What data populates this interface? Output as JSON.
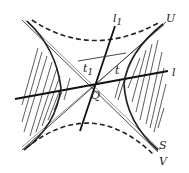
{
  "diagram": {
    "type": "geometry",
    "center": {
      "label": "Q"
    },
    "labels": {
      "U": "U",
      "S": "S",
      "V": "V",
      "l": "l",
      "l1_main": "l",
      "l1_sub": "1",
      "t": "t",
      "t1_main": "t",
      "t1_sub": "1",
      "Q": "Q"
    },
    "elements": [
      {
        "name": "asymptote-1",
        "style": "thin solid",
        "label": "U"
      },
      {
        "name": "asymptote-2",
        "style": "thin solid",
        "label": "V"
      },
      {
        "name": "hyperbola-solid",
        "style": "thick solid, hatched exterior",
        "label": "S"
      },
      {
        "name": "hyperbola-conjugate",
        "style": "dashed"
      },
      {
        "name": "diameter-l",
        "style": "thick solid",
        "label": "l"
      },
      {
        "name": "diameter-l1",
        "style": "thick solid",
        "label": "l1"
      },
      {
        "name": "tangent-t",
        "style": "thin solid",
        "label": "t"
      },
      {
        "name": "tangent-t1",
        "style": "thin solid",
        "label": "t1"
      }
    ],
    "colors": {
      "ink": "#222222",
      "background": "#ffffff"
    }
  }
}
